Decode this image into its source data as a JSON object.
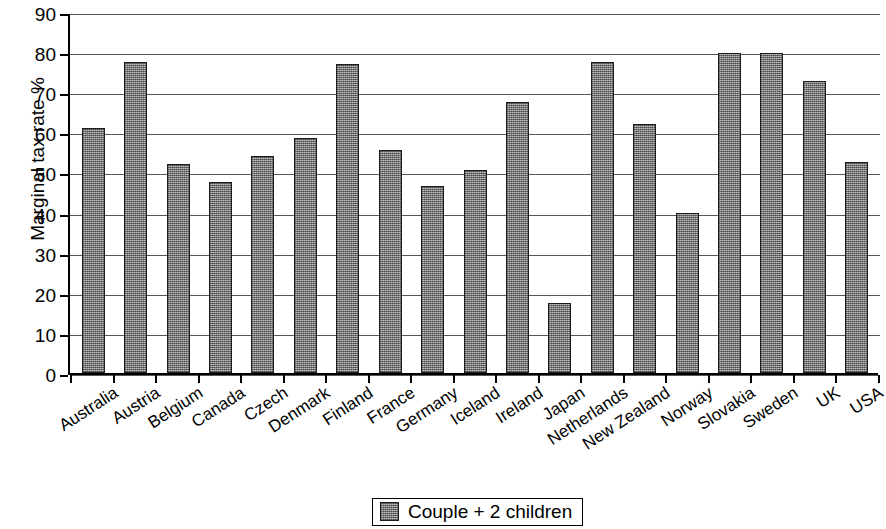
{
  "chart_data": {
    "type": "bar",
    "title": "",
    "xlabel": "",
    "ylabel": "Marginal tax rate %",
    "ylim": [
      0,
      90
    ],
    "y_ticks": [
      0,
      10,
      20,
      30,
      40,
      50,
      60,
      70,
      80,
      90
    ],
    "grid": true,
    "legend_position": "bottom-center",
    "bar_color": "#8a8a8a",
    "bar_border_color": "#1c1c1c",
    "categories": [
      "Australia",
      "Austria",
      "Belgium",
      "Canada",
      "Czech",
      "Denmark",
      "Finland",
      "France",
      "Germany",
      "Iceland",
      "Ireland",
      "Japan",
      "Netherlands",
      "New Zealand",
      "Norway",
      "Slovakia",
      "Sweden",
      "UK",
      "USA"
    ],
    "series": [
      {
        "name": "Couple + 2 children",
        "values": [
          61,
          77.5,
          52,
          47.5,
          54,
          58.5,
          77,
          55.5,
          46.5,
          50.5,
          67.5,
          17.5,
          77.5,
          62,
          40,
          79.7,
          79.7,
          72.7,
          52.5
        ]
      }
    ]
  },
  "legend": {
    "entries": [
      {
        "label": "Couple + 2 children",
        "swatch_name": "couple-2-children-swatch"
      }
    ]
  }
}
